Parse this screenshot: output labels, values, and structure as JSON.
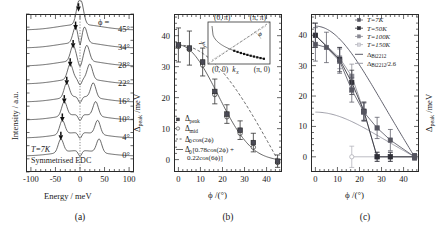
{
  "figure": {
    "panels": [
      {
        "tag": "(a)"
      },
      {
        "tag": "(b)"
      },
      {
        "tag": "(c)"
      }
    ]
  },
  "panel_a": {
    "tag": "(a)",
    "ylabel": "Intensity / a.u.",
    "xlabel": "Energy / meV",
    "xticks": [
      "-100",
      "-50",
      "0",
      "50",
      "100"
    ],
    "xtick_values": [
      -100,
      -50,
      0,
      50,
      100
    ],
    "xlim": [
      -110,
      110
    ],
    "phi_header": "ϕ =",
    "annotation_temp": "T=7K",
    "annotation_type": "Symmetrised EDC",
    "curve_labels": [
      "45°",
      "34°",
      "28°",
      "22°",
      "16°",
      "10°",
      "4°",
      "0°"
    ],
    "gap_marker_positions_meV": [
      -3,
      -9,
      -14,
      -20,
      -27,
      -32,
      -36,
      -39
    ],
    "marker_name": "gap-peak-arrow"
  },
  "panel_b": {
    "tag": "(b)",
    "ylabel": "Δ_peak / meV",
    "xlabel": "ϕ /(°)",
    "xticks": [
      "0",
      "10",
      "20",
      "30",
      "40"
    ],
    "yticks": [
      "0",
      "10",
      "20",
      "30",
      "40"
    ],
    "xlim": [
      -2,
      47
    ],
    "ylim": [
      -4,
      47
    ],
    "legend": [
      {
        "key": "filled-square",
        "label": "Δ_peak"
      },
      {
        "key": "open-circle",
        "label": "Δ_mid"
      },
      {
        "key": "dashed-line",
        "label": "Δ₀ cos(2ϕ)"
      },
      {
        "key": "solid-line",
        "label": "Δ₀[0.78cos(2ϕ) + 0.22cos(6ϕ)]"
      }
    ],
    "inset": {
      "label_top_left": "(0, π)",
      "label_top_right": "(π, π)",
      "label_bottom_left": "(0, 0)",
      "label_bottom_right": "(π, 0)",
      "label_kx": "k_x",
      "label_ky": "k_y",
      "label_phi": "ϕ"
    }
  },
  "panel_c": {
    "tag": "(c)",
    "ylabel": "Δ_peak / meV",
    "xlabel": "ϕ /(°)",
    "xticks": [
      "0",
      "10",
      "20",
      "30",
      "40"
    ],
    "yticks": [
      "0",
      "10",
      "20",
      "30",
      "40"
    ],
    "xlim": [
      -2,
      47
    ],
    "ylim": [
      -5,
      47
    ],
    "legend": [
      {
        "key": "marker-7k",
        "label": "T=7K"
      },
      {
        "key": "marker-50k",
        "label": "T=50K"
      },
      {
        "key": "marker-100k",
        "label": "T=100K"
      },
      {
        "key": "marker-150k",
        "label": "T=150K"
      },
      {
        "key": "line-bi2212",
        "label": "Δ_Bi2212"
      },
      {
        "key": "line-bi2212-scaled",
        "label": "Δ_Bi2212/2.6"
      }
    ]
  },
  "chart_data": [
    {
      "type": "line",
      "panel": "a",
      "title": "",
      "xlabel": "Energy / meV",
      "ylabel": "Intensity / a.u.",
      "xlim": [
        -110,
        110
      ],
      "grid": false,
      "annotations": [
        "T=7K",
        "Symmetrised EDC",
        "ϕ ="
      ],
      "series": [
        {
          "name": "45°",
          "gap_marker_meV": -3
        },
        {
          "name": "34°",
          "gap_marker_meV": -9
        },
        {
          "name": "28°",
          "gap_marker_meV": -14
        },
        {
          "name": "22°",
          "gap_marker_meV": -20
        },
        {
          "name": "16°",
          "gap_marker_meV": -27
        },
        {
          "name": "10°",
          "gap_marker_meV": -32
        },
        {
          "name": "4°",
          "gap_marker_meV": -36
        },
        {
          "name": "0°",
          "gap_marker_meV": -39
        }
      ]
    },
    {
      "type": "scatter",
      "panel": "b",
      "title": "",
      "xlabel": "ϕ /(°)",
      "ylabel": "Δ_peak / meV",
      "xlim": [
        -2,
        47
      ],
      "ylim": [
        -4,
        47
      ],
      "grid": false,
      "legend_position": "lower-left",
      "series": [
        {
          "name": "Δ_peak",
          "marker": "filled-square",
          "x": [
            0,
            5,
            11,
            16.5,
            22,
            28,
            34,
            45
          ],
          "y": [
            37,
            36,
            31.5,
            22,
            14.7,
            9.5,
            5.5,
            -0.5
          ],
          "yerr": [
            5.5,
            5.5,
            4.5,
            4.0,
            3.0,
            3.0,
            3.0,
            2.0
          ]
        },
        {
          "name": "Δ_mid",
          "marker": "open-circle",
          "x": [
            0,
            5,
            11,
            16.5,
            22,
            28,
            34,
            45
          ],
          "y": [
            36.5,
            35.5,
            30.5,
            21,
            13.8,
            8.5,
            4.0,
            -1.0
          ]
        },
        {
          "name": "Δ₀ cos(2ϕ)",
          "style": "dashed",
          "amplitude": 37
        },
        {
          "name": "Δ₀[0.78cos(2ϕ) + 0.22cos(6ϕ)]",
          "style": "solid",
          "amplitude": 37
        }
      ]
    },
    {
      "type": "scatter",
      "panel": "c",
      "title": "",
      "xlabel": "ϕ /(°)",
      "ylabel": "Δ_peak / meV",
      "xlim": [
        -2,
        47
      ],
      "ylim": [
        -5,
        47
      ],
      "grid": false,
      "legend_position": "upper-right",
      "series": [
        {
          "name": "T=7K",
          "marker": "filled-square",
          "x": [
            0,
            5,
            11,
            16.5,
            22,
            28,
            34,
            45
          ],
          "y": [
            37,
            36,
            31.5,
            22,
            14.7,
            9.5,
            5.5,
            0
          ],
          "yerr": [
            5.5,
            5.0,
            4.0,
            4.0,
            3.0,
            3.5,
            3.5,
            1.0
          ]
        },
        {
          "name": "T=50K",
          "marker": "filled-square-dark",
          "x": [
            0,
            11,
            16.5,
            22,
            28,
            34,
            45
          ],
          "y": [
            40,
            32,
            24.5,
            15,
            0,
            0,
            0
          ],
          "yerr": [
            4.0,
            4.0,
            4.0,
            3.0,
            1.5,
            1.5,
            1.0
          ]
        },
        {
          "name": "T=100K",
          "marker": "filled-square-grey",
          "x": [
            0,
            11,
            16.5,
            22,
            28,
            34,
            45
          ],
          "y": [
            40,
            32.5,
            26.5,
            15,
            0,
            0,
            0
          ],
          "yerr": [
            4.0,
            3.5,
            4.0,
            3.0,
            1.5,
            1.5,
            1.0
          ]
        },
        {
          "name": "T=150K",
          "marker": "open-circle-light",
          "x": [
            16.5,
            45
          ],
          "y": [
            0,
            0
          ],
          "yerr": [
            3.5,
            1.0
          ]
        },
        {
          "name": "Δ_Bi2212",
          "style": "solid-dark",
          "amplitude": 43
        },
        {
          "name": "Δ_Bi2212/2.6",
          "style": "solid-light",
          "amplitude": 14.7
        }
      ]
    }
  ]
}
